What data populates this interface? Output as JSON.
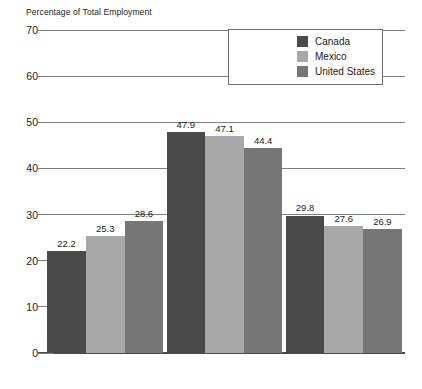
{
  "chart_data": {
    "type": "bar",
    "title": "Percentage of Total Employment",
    "xlabel": "",
    "ylabel": "Percentage of Total Employment",
    "ylim": [
      0,
      70
    ],
    "yticks": [
      0,
      10,
      20,
      30,
      40,
      50,
      60,
      70
    ],
    "grid": "horizontal gridlines at 30, 40, 50, 60, 70; short tick marks at 0, 10, 20",
    "legend_position": "upper-right inside plot area",
    "categories": [
      "1 Year or Less",
      ">1 Year and <10 Years",
      "More than 10 Years"
    ],
    "series": [
      {
        "name": "Canada",
        "color": "#4a4a4a",
        "values": [
          22.2,
          47.9,
          29.8
        ]
      },
      {
        "name": "Mexico",
        "color": "#a8a8a8",
        "values": [
          25.3,
          47.1,
          27.6
        ]
      },
      {
        "name": "United States",
        "color": "#767676",
        "values": [
          28.6,
          44.4,
          26.9
        ]
      }
    ]
  },
  "axis": {
    "title": "Percentage of Total Employment",
    "ytick_labels": [
      "70",
      "60",
      "50",
      "40",
      "30",
      "20",
      "10",
      "0"
    ]
  },
  "legend": {
    "items": [
      {
        "label": "Canada"
      },
      {
        "label": "Mexico"
      },
      {
        "label": "United States"
      }
    ]
  }
}
